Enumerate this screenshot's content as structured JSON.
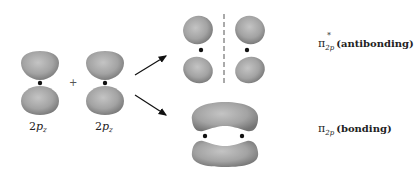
{
  "figure": {
    "atomic_orbitals": [
      {
        "label_main": "2",
        "label_p": "p",
        "label_sub": "z"
      },
      {
        "label_main": "2",
        "label_p": "p",
        "label_sub": "z"
      }
    ],
    "combine_symbol": "+",
    "molecular_orbitals": {
      "antibonding": {
        "symbol": "π",
        "star": "*",
        "subscript": "2p",
        "description": "(antibonding)"
      },
      "bonding": {
        "symbol": "π",
        "subscript": "2p",
        "description": "(bonding)"
      }
    }
  },
  "colors": {
    "lobe_fill_center": "#b8b8b8",
    "lobe_fill_edge": "#7a7a7a",
    "nucleus": "#111111",
    "arrow": "#111111",
    "node_line": "#555555"
  }
}
